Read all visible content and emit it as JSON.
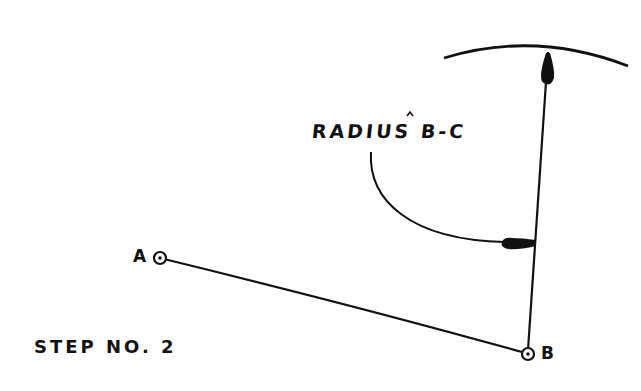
{
  "diagram": {
    "title": "STEP NO. 2",
    "annotation": "RADIUS B-C",
    "points": [
      {
        "label": "A",
        "x": 160,
        "y": 258
      },
      {
        "label": "B",
        "x": 528,
        "y": 354
      }
    ],
    "segments": [
      {
        "from": "A",
        "to": "B"
      },
      {
        "from": "B",
        "to": "C-direction",
        "note": "radius line toward arc"
      }
    ],
    "arc": {
      "description": "arc swung from B with radius B-C",
      "top_y": 50
    },
    "colors": {
      "ink": "#111111",
      "background": "#ffffff"
    }
  }
}
